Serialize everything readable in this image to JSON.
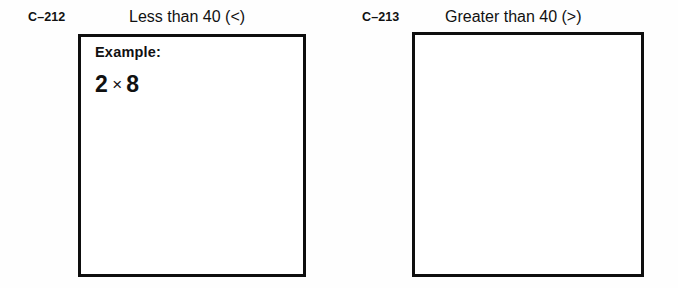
{
  "page": {
    "background_color": "#fefefe",
    "ink_color": "#111111",
    "box_border_color": "#0e0e0e"
  },
  "panels": [
    {
      "code": "C–212",
      "title": "Less than 40 (<)",
      "has_example": true,
      "example": {
        "label": "Example:",
        "operand_left": "2",
        "operator": "×",
        "operand_right": "8"
      }
    },
    {
      "code": "C–213",
      "title": "Greater than 40 (>)",
      "has_example": false,
      "example": {
        "label": "",
        "operand_left": "",
        "operator": "",
        "operand_right": ""
      }
    }
  ]
}
